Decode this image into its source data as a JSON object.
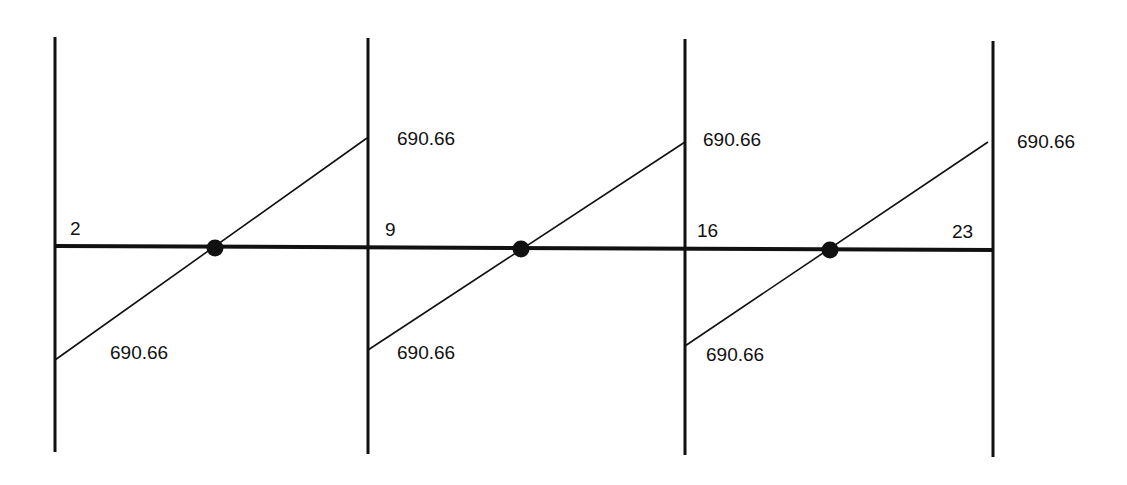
{
  "diagram": {
    "type": "influence-line / moment diagram",
    "colors": {
      "stroke": "#111111",
      "background": "#ffffff"
    },
    "supports": [
      {
        "id": "A",
        "x": 55,
        "y1": 37,
        "y2": 452
      },
      {
        "id": "B",
        "x": 368,
        "y1": 38,
        "y2": 454
      },
      {
        "id": "C",
        "x": 685,
        "y1": 39,
        "y2": 455
      },
      {
        "id": "D",
        "x": 993,
        "y1": 41,
        "y2": 457
      }
    ],
    "baseline": {
      "x1": 55,
      "y1": 246,
      "x2": 993,
      "y2": 250
    },
    "spans": [
      {
        "diagonal": {
          "x1": 55,
          "y1": 360,
          "x2": 367,
          "y2": 138
        },
        "zero_point": {
          "x": 215,
          "y": 248
        },
        "upper_value": "690.66",
        "lower_value": "690.66"
      },
      {
        "diagonal": {
          "x1": 368,
          "y1": 350,
          "x2": 685,
          "y2": 142
        },
        "zero_point": {
          "x": 521,
          "y": 249
        },
        "upper_value": "690.66",
        "lower_value": "690.66"
      },
      {
        "diagonal": {
          "x1": 685,
          "y1": 346,
          "x2": 988,
          "y2": 142
        },
        "zero_point": {
          "x": 830,
          "y": 250
        },
        "upper_value": "690.66",
        "lower_value": "690.66"
      }
    ],
    "node_labels": [
      "2",
      "9",
      "16",
      "23"
    ]
  }
}
